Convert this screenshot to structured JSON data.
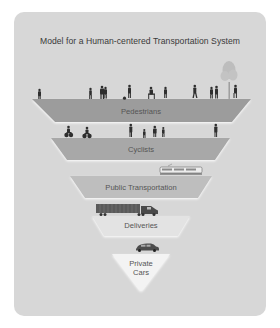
{
  "title": "Model for a Human-centered Transportation System",
  "colors": {
    "card": "#d7d7d7",
    "silhouette": "#2e2e2e",
    "tree": "#bdbdbd"
  },
  "tiers": [
    {
      "label": "Pedestrians",
      "icon": "pedestrians-icon",
      "color": "#9c9c9c"
    },
    {
      "label": "Cyclists",
      "icon": "cyclists-icon",
      "color": "#a8a8a8"
    },
    {
      "label": "Public Transportation",
      "icon": "tram-icon",
      "color": "#bebebe"
    },
    {
      "label": "Deliveries",
      "icon": "truck-icon",
      "color": "#e3e3e3"
    },
    {
      "label": "Private",
      "label_line2": "Cars",
      "icon": "car-icon",
      "color": "#f3f3f3"
    }
  ]
}
